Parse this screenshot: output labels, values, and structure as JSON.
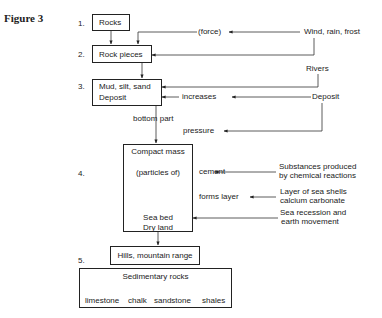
{
  "figure_label": "Figure 3",
  "steps": [
    {
      "num": "1.",
      "box": "Rocks"
    },
    {
      "num": "2.",
      "box": "Rock pieces"
    },
    {
      "num": "3.",
      "box_line1": "Mud, silt, sand",
      "box_line2": "Deposit"
    },
    {
      "num": "4.",
      "box_top": "Compact mass",
      "box_mid": "(particles of)",
      "box_bot1": "Sea bed",
      "box_bot2": "Dry land"
    },
    {
      "num": "5.",
      "box": "Hills, mountain range"
    }
  ],
  "labels": {
    "force": "(force)",
    "wind": "Wind, rain, frost",
    "rivers": "Rivers",
    "increases": "increases",
    "deposit_right": "Deposit",
    "bottom_part": "bottom part",
    "pressure": "pressure",
    "cement": "cement",
    "substances1": "Substances produced",
    "substances2": "by chemical reactions",
    "forms_layer": "forms layer",
    "shells1": "Layer of sea shells",
    "shells2": "calcium carbonate",
    "recession1": "Sea recession and",
    "recession2": "earth movement"
  },
  "sedimentary": {
    "title": "Sedimentary rocks",
    "types": [
      "limestone",
      "chalk",
      "sandstone",
      "shales"
    ]
  }
}
